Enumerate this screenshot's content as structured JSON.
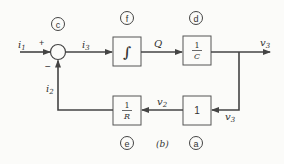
{
  "diagram": {
    "figure_label": "(b)",
    "summing_junction": {
      "tag": "c",
      "plus_sign": "+",
      "minus_sign": "−"
    },
    "signals": {
      "input": {
        "name": "i",
        "sub": "1"
      },
      "feedback": {
        "name": "i",
        "sub": "2"
      },
      "sum_out": {
        "name": "i",
        "sub": "3"
      },
      "charge": {
        "name": "Q"
      },
      "output": {
        "name": "v",
        "sub": "3"
      },
      "branch_in": {
        "name": "v",
        "sub": "3"
      },
      "gain_out": {
        "name": "v",
        "sub": "2"
      }
    },
    "blocks": [
      {
        "id": "integrator",
        "tag": "f",
        "symbol": "∫"
      },
      {
        "id": "inv-capacitance",
        "tag": "d",
        "num": "1",
        "den": "C"
      },
      {
        "id": "unity-gain",
        "tag": "a",
        "value": "1"
      },
      {
        "id": "inv-resistance",
        "tag": "e",
        "num": "1",
        "den": "R"
      }
    ]
  }
}
